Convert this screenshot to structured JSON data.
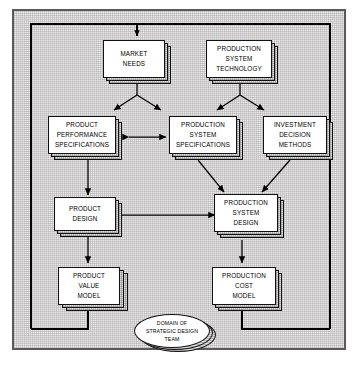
{
  "diagram": {
    "type": "flowchart",
    "background_color": "#eceaea",
    "box_fill_color": "#ffffff",
    "line_color": "#000000",
    "nodes": [
      {
        "id": "market_needs",
        "lines": [
          "MARKET",
          "NEEDS"
        ]
      },
      {
        "id": "production_system_tech",
        "lines": [
          "PRODUCTION",
          "SYSTEM",
          "TECHNOLOGY"
        ]
      },
      {
        "id": "product_perf_specs",
        "lines": [
          "PRODUCT",
          "PERFORMANCE",
          "SPECIFICATIONS"
        ]
      },
      {
        "id": "production_system_specs",
        "lines": [
          "PRODUCTION",
          "SYSTEM",
          "SPECIFICATIONS"
        ]
      },
      {
        "id": "investment_decision",
        "lines": [
          "INVESTMENT",
          "DECISION",
          "METHODS"
        ]
      },
      {
        "id": "product_design",
        "lines": [
          "PRODUCT",
          "DESIGN"
        ]
      },
      {
        "id": "production_system_design",
        "lines": [
          "PRODUCTION",
          "SYSTEM",
          "DESIGN"
        ]
      },
      {
        "id": "product_value_model",
        "lines": [
          "PRODUCT",
          "VALUE",
          "MODEL"
        ]
      },
      {
        "id": "production_cost_model",
        "lines": [
          "PRODUCTION",
          "COST",
          "MODEL"
        ]
      }
    ],
    "ellipse": {
      "id": "domain_label",
      "lines": [
        "DOMAIN OF",
        "STRATEGIC DESIGN",
        "TEAM"
      ]
    },
    "edges": [
      {
        "from": "feedback_loop",
        "to": "market_needs",
        "style": "arrow"
      },
      {
        "from": "market_needs",
        "to": "product_perf_specs",
        "style": "arrow"
      },
      {
        "from": "market_needs",
        "to": "production_system_specs",
        "style": "arrow"
      },
      {
        "from": "production_system_tech",
        "to": "production_system_specs",
        "style": "arrow"
      },
      {
        "from": "production_system_tech",
        "to": "investment_decision",
        "style": "arrow"
      },
      {
        "from": "product_perf_specs",
        "to": "production_system_specs",
        "style": "double-arrow"
      },
      {
        "from": "product_perf_specs",
        "to": "product_design",
        "style": "arrow"
      },
      {
        "from": "production_system_specs",
        "to": "production_system_design",
        "style": "arrow"
      },
      {
        "from": "investment_decision",
        "to": "production_system_design",
        "style": "arrow"
      },
      {
        "from": "product_design",
        "to": "production_system_design",
        "style": "double-arrow"
      },
      {
        "from": "product_design",
        "to": "product_value_model",
        "style": "arrow"
      },
      {
        "from": "production_system_design",
        "to": "production_cost_model",
        "style": "arrow"
      },
      {
        "from": "product_value_model",
        "to": "feedback_loop",
        "style": "line"
      },
      {
        "from": "production_cost_model",
        "to": "feedback_loop",
        "style": "line"
      }
    ]
  }
}
